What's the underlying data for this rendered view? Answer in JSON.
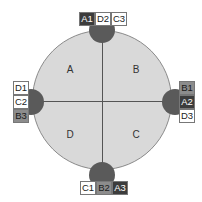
{
  "quadrants": {
    "top_left": "A",
    "top_right": "B",
    "bottom_right": "C",
    "bottom_left": "D"
  },
  "ports": {
    "top": [
      {
        "label": "A1",
        "shade": "dark"
      },
      {
        "label": "D2",
        "shade": "light"
      },
      {
        "label": "C3",
        "shade": "light"
      }
    ],
    "right": [
      {
        "label": "B1",
        "shade": "mid"
      },
      {
        "label": "A2",
        "shade": "dark"
      },
      {
        "label": "D3",
        "shade": "light"
      }
    ],
    "bottom": [
      {
        "label": "C1",
        "shade": "light"
      },
      {
        "label": "B2",
        "shade": "mid"
      },
      {
        "label": "A3",
        "shade": "dark"
      }
    ],
    "left": [
      {
        "label": "D1",
        "shade": "light"
      },
      {
        "label": "C2",
        "shade": "light"
      },
      {
        "label": "B3",
        "shade": "mid"
      }
    ]
  },
  "colors": {
    "circle": "#d9d9d9",
    "knob": "#5a5a5a",
    "dark": "#3c3c3c",
    "mid": "#8c8c8c",
    "light": "#ffffff"
  }
}
